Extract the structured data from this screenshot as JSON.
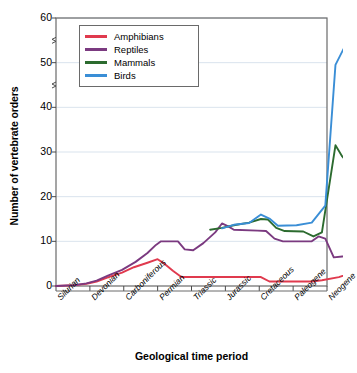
{
  "chart_data": {
    "type": "line",
    "title": "",
    "xlabel": "Geological time period",
    "ylabel": "Number of vertebrate orders",
    "categories": [
      "Silurian",
      "Devonian",
      "Carboniferous",
      "Permian",
      "Triassic",
      "Jurassic",
      "Cretaceous",
      "Paleogene",
      "Neogene"
    ],
    "ylim": [
      0,
      60
    ],
    "yticks": [
      0,
      10,
      20,
      30,
      40,
      50,
      60
    ],
    "grid": true,
    "grid_axis": "y",
    "legend_position": "top-left",
    "axis_break": true,
    "axis_break_positions": [
      45,
      55
    ],
    "series": [
      {
        "name": "Amphibians",
        "color": "#e03a4e",
        "points": [
          [
            0.0,
            0.0
          ],
          [
            0.55,
            0.2
          ],
          [
            0.9,
            0.5
          ],
          [
            1.2,
            1.0
          ],
          [
            1.55,
            2.0
          ],
          [
            1.95,
            3.0
          ],
          [
            2.3,
            4.2
          ],
          [
            2.7,
            5.2
          ],
          [
            3.0,
            6.0
          ],
          [
            3.2,
            5.0
          ],
          [
            3.45,
            3.4
          ],
          [
            3.7,
            2.0
          ],
          [
            4.6,
            2.0
          ],
          [
            5.6,
            2.0
          ],
          [
            6.05,
            2.0
          ],
          [
            6.3,
            1.0
          ],
          [
            7.55,
            1.0
          ],
          [
            7.85,
            1.3
          ],
          [
            8.35,
            2.0
          ],
          [
            8.8,
            3.0
          ]
        ]
      },
      {
        "name": "Reptiles",
        "color": "#7b3a80",
        "points": [
          [
            0.0,
            0.0
          ],
          [
            0.55,
            0.2
          ],
          [
            0.9,
            0.6
          ],
          [
            1.2,
            1.2
          ],
          [
            1.55,
            2.4
          ],
          [
            1.95,
            3.6
          ],
          [
            2.35,
            5.4
          ],
          [
            2.7,
            7.4
          ],
          [
            2.95,
            9.2
          ],
          [
            3.1,
            10.0
          ],
          [
            3.45,
            10.0
          ],
          [
            3.6,
            10.0
          ],
          [
            3.8,
            8.2
          ],
          [
            4.05,
            8.0
          ],
          [
            4.35,
            9.6
          ],
          [
            4.7,
            12.0
          ],
          [
            4.9,
            14.0
          ],
          [
            5.1,
            13.3
          ],
          [
            5.25,
            12.6
          ],
          [
            5.95,
            12.4
          ],
          [
            6.2,
            12.3
          ],
          [
            6.45,
            10.6
          ],
          [
            6.7,
            10.0
          ],
          [
            7.55,
            10.0
          ],
          [
            7.75,
            11.1
          ],
          [
            7.95,
            10.6
          ],
          [
            8.2,
            6.4
          ],
          [
            8.45,
            6.6
          ],
          [
            8.8,
            7.7
          ]
        ]
      },
      {
        "name": "Mammals",
        "color": "#2c6b2f",
        "points": [
          [
            4.55,
            12.6
          ],
          [
            4.9,
            13.0
          ],
          [
            5.25,
            13.6
          ],
          [
            5.7,
            14.2
          ],
          [
            6.05,
            15.0
          ],
          [
            6.25,
            14.9
          ],
          [
            6.5,
            13.0
          ],
          [
            6.75,
            12.3
          ],
          [
            7.3,
            12.2
          ],
          [
            7.6,
            11.1
          ],
          [
            7.85,
            12.0
          ],
          [
            8.25,
            31.5
          ],
          [
            8.45,
            29.0
          ],
          [
            8.8,
            26.0
          ]
        ]
      },
      {
        "name": "Birds",
        "color": "#3a8ed6",
        "points": [
          [
            4.9,
            12.9
          ],
          [
            5.25,
            13.7
          ],
          [
            5.7,
            14.1
          ],
          [
            6.05,
            16.0
          ],
          [
            6.3,
            15.1
          ],
          [
            6.55,
            13.5
          ],
          [
            7.1,
            13.6
          ],
          [
            7.55,
            14.2
          ],
          [
            7.95,
            18.0
          ],
          [
            8.25,
            49.5
          ],
          [
            8.55,
            54.0
          ],
          [
            8.8,
            59.0
          ]
        ]
      }
    ]
  },
  "legend": {
    "items": [
      {
        "label": "Amphibians",
        "color": "#e03a4e"
      },
      {
        "label": "Reptiles",
        "color": "#7b3a80"
      },
      {
        "label": "Mammals",
        "color": "#2c6b2f"
      },
      {
        "label": "Birds",
        "color": "#3a8ed6"
      }
    ]
  },
  "axes": {
    "y_tick_labels": [
      "60",
      "50",
      "40",
      "30",
      "20",
      "10",
      "0"
    ],
    "x_tick_labels": [
      "Silurian",
      "Devonian",
      "Carboniferous",
      "Permian",
      "Triassic",
      "Jurassic",
      "Cretaceous",
      "Paleogene",
      "Neogene"
    ],
    "y_axis_title": "Number of vertebrate orders",
    "x_axis_title": "Geological time period"
  }
}
